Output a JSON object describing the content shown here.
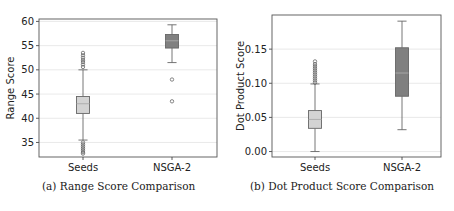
{
  "chart_data": [
    {
      "type": "box",
      "title": "",
      "caption": "(a) Range Score Comparison",
      "xlabel": "",
      "ylabel": "Range Score",
      "categories": [
        "Seeds",
        "NSGA-2"
      ],
      "ylim": [
        32,
        60.5
      ],
      "yticks": [
        35,
        40,
        45,
        50,
        55,
        60
      ],
      "grid": "horizontal",
      "series": [
        {
          "name": "Seeds",
          "color": "#d3d3d3",
          "whisker_low": 35.5,
          "q1": 41.0,
          "median": 43.0,
          "q3": 44.5,
          "whisker_high": 50.0,
          "outliers": [
            50.6,
            51.1,
            51.6,
            52.0,
            52.5,
            53.0,
            53.5,
            35.0,
            34.6,
            34.2,
            33.8,
            33.4,
            33.0,
            32.7
          ]
        },
        {
          "name": "NSGA-2",
          "color": "#808080",
          "whisker_low": 51.5,
          "q1": 54.5,
          "median": 56.0,
          "q3": 57.3,
          "whisker_high": 59.3,
          "outliers": [
            48.0,
            43.5
          ]
        }
      ]
    },
    {
      "type": "box",
      "title": "",
      "caption": "(b) Dot Product Score Comparison",
      "xlabel": "",
      "ylabel": "Dot Product Score",
      "categories": [
        "Seeds",
        "NSGA-2"
      ],
      "ylim": [
        -0.008,
        0.2
      ],
      "yticks": [
        0.0,
        0.05,
        0.1,
        0.15
      ],
      "ytick_labels": [
        "0.00",
        "0.05",
        "0.10",
        "0.15"
      ],
      "grid": "horizontal",
      "series": [
        {
          "name": "Seeds",
          "color": "#d3d3d3",
          "whisker_low": 0.0,
          "q1": 0.034,
          "median": 0.047,
          "q3": 0.06,
          "whisker_high": 0.099,
          "outliers": [
            0.101,
            0.104,
            0.107,
            0.11,
            0.113,
            0.116,
            0.119,
            0.122,
            0.125,
            0.128,
            0.132
          ]
        },
        {
          "name": "NSGA-2",
          "color": "#808080",
          "whisker_low": 0.032,
          "q1": 0.081,
          "median": 0.115,
          "q3": 0.152,
          "whisker_high": 0.191,
          "outliers": []
        }
      ]
    }
  ],
  "captions": {
    "a": "(a) Range Score Comparison",
    "b": "(b) Dot Product Score Comparison"
  }
}
